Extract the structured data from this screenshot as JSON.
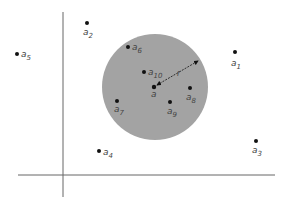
{
  "diagram": {
    "background": "#ffffff",
    "axis_color": "#666666",
    "disk_color": "#a3a3a3",
    "point_color": "#111111",
    "axes": {
      "x_axis": {
        "x1": 18,
        "y1": 175,
        "x2": 275,
        "y2": 175
      },
      "y_axis": {
        "x1": 63,
        "y1": 12,
        "x2": 63,
        "y2": 197
      }
    },
    "disk": {
      "cx": 155,
      "cy": 87,
      "r": 53,
      "label_center": "a",
      "radius_label": "r"
    },
    "center_point": {
      "name": "a",
      "x": 154,
      "y": 87,
      "label": "a"
    },
    "points": [
      {
        "name": "a1",
        "base": "a",
        "sub": "1",
        "x": 235,
        "y": 52,
        "lx": 231,
        "ly": 66,
        "inside": false
      },
      {
        "name": "a2",
        "base": "a",
        "sub": "2",
        "x": 87,
        "y": 23,
        "lx": 83,
        "ly": 35,
        "inside": false
      },
      {
        "name": "a3",
        "base": "a",
        "sub": "3",
        "x": 256,
        "y": 141,
        "lx": 252,
        "ly": 153,
        "inside": false
      },
      {
        "name": "a4",
        "base": "a",
        "sub": "4",
        "x": 99,
        "y": 151,
        "lx": 103,
        "ly": 155,
        "inside": false
      },
      {
        "name": "a5",
        "base": "a",
        "sub": "5",
        "x": 17,
        "y": 54,
        "lx": 21,
        "ly": 57,
        "inside": false
      },
      {
        "name": "a6",
        "base": "a",
        "sub": "6",
        "x": 128,
        "y": 47,
        "lx": 132,
        "ly": 50,
        "inside": true
      },
      {
        "name": "a7",
        "base": "a",
        "sub": "7",
        "x": 117,
        "y": 101,
        "lx": 114,
        "ly": 112,
        "inside": true
      },
      {
        "name": "a8",
        "base": "a",
        "sub": "8",
        "x": 190,
        "y": 88,
        "lx": 186,
        "ly": 100,
        "inside": true
      },
      {
        "name": "a9",
        "base": "a",
        "sub": "9",
        "x": 170,
        "y": 102,
        "lx": 167,
        "ly": 114,
        "inside": true
      },
      {
        "name": "a10",
        "base": "a",
        "sub": "10",
        "x": 144,
        "y": 72,
        "lx": 148,
        "ly": 75,
        "inside": true
      }
    ],
    "radius_arrow": {
      "x1": 157,
      "y1": 85,
      "x2": 198,
      "y2": 61,
      "label": "r",
      "label_x": 177,
      "label_y": 76
    }
  }
}
